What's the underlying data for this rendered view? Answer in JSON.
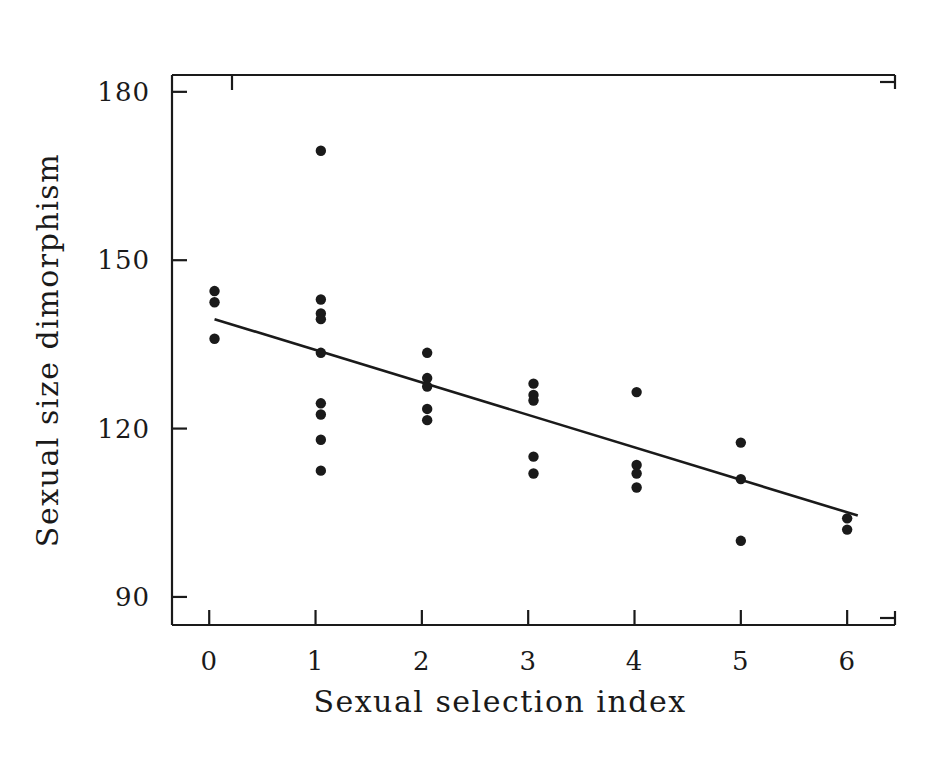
{
  "figure": {
    "background": "#ffffff",
    "ink_color": "#1a1a1a",
    "point_color": "#1a1a1a",
    "line_color": "#1a1a1a"
  },
  "chart_data": {
    "type": "scatter",
    "title": "",
    "subtitle": "",
    "xlabel": "Sexual selection index",
    "ylabel": "Sexual size dimorphism",
    "xlim": [
      -0.35,
      6.45
    ],
    "ylim": [
      85,
      183
    ],
    "grid": false,
    "legend": null,
    "x_ticks": [
      0,
      1,
      2,
      3,
      4,
      5,
      6
    ],
    "x_tick_labels": [
      "0",
      "1",
      "2",
      "3",
      "4",
      "5",
      "6"
    ],
    "y_ticks": [
      90,
      120,
      150,
      180
    ],
    "y_tick_labels": [
      "90",
      "120",
      "150",
      "180"
    ],
    "points": [
      {
        "x": 0.05,
        "y": 144.5
      },
      {
        "x": 0.05,
        "y": 142.5
      },
      {
        "x": 0.05,
        "y": 136.0
      },
      {
        "x": 1.05,
        "y": 169.5
      },
      {
        "x": 1.05,
        "y": 143.0
      },
      {
        "x": 1.05,
        "y": 140.5
      },
      {
        "x": 1.05,
        "y": 139.5
      },
      {
        "x": 1.05,
        "y": 133.5
      },
      {
        "x": 1.05,
        "y": 124.5
      },
      {
        "x": 1.05,
        "y": 122.5
      },
      {
        "x": 1.05,
        "y": 118.0
      },
      {
        "x": 1.05,
        "y": 112.5
      },
      {
        "x": 2.05,
        "y": 133.5
      },
      {
        "x": 2.05,
        "y": 129.0
      },
      {
        "x": 2.05,
        "y": 127.5
      },
      {
        "x": 2.05,
        "y": 123.5
      },
      {
        "x": 2.05,
        "y": 121.5
      },
      {
        "x": 3.05,
        "y": 128.0
      },
      {
        "x": 3.05,
        "y": 126.0
      },
      {
        "x": 3.05,
        "y": 125.0
      },
      {
        "x": 3.05,
        "y": 115.0
      },
      {
        "x": 3.05,
        "y": 112.0
      },
      {
        "x": 4.02,
        "y": 126.5
      },
      {
        "x": 4.02,
        "y": 113.5
      },
      {
        "x": 4.02,
        "y": 112.0
      },
      {
        "x": 4.02,
        "y": 109.5
      },
      {
        "x": 5.0,
        "y": 117.5
      },
      {
        "x": 5.0,
        "y": 111.0
      },
      {
        "x": 5.0,
        "y": 100.0
      },
      {
        "x": 6.0,
        "y": 104.0
      },
      {
        "x": 6.0,
        "y": 102.0
      }
    ],
    "regression_line": {
      "label": "fitted regression line",
      "x_start": 0.05,
      "y_start": 139.5,
      "x_end": 6.1,
      "y_end": 104.5
    }
  }
}
